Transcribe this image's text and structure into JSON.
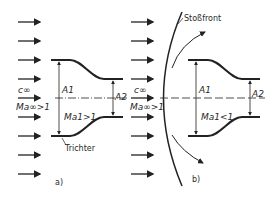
{
  "diagram": {
    "panel_a": {
      "label": "a)",
      "free_stream_velocity": "c∞",
      "free_stream_mach": "Ma∞>1",
      "inlet_area": "A1",
      "outlet_area": "A2",
      "inlet_mach": "Ma1>1",
      "funnel_label": "Trichter"
    },
    "panel_b": {
      "label": "b)",
      "free_stream_velocity": "c∞",
      "free_stream_mach": "Ma∞>1",
      "inlet_area": "A1",
      "outlet_area": "A2",
      "inlet_mach": "Ma1<1",
      "shock_label": "Stoßfront"
    },
    "stroke_color": "#222222",
    "background": "#ffffff"
  }
}
